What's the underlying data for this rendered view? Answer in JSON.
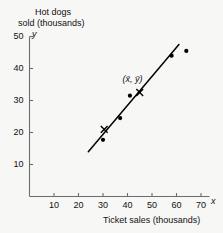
{
  "chart_data": {
    "type": "scatter",
    "title": "",
    "ylabel_lines": [
      "Hot dogs",
      "sold (thousands)"
    ],
    "ylabel": "Hot dogs sold (thousands)",
    "xlabel": "Ticket sales (thousands)",
    "x_axis_letter": "x",
    "y_axis_letter": "y",
    "xlim": [
      0,
      75
    ],
    "ylim": [
      0,
      53
    ],
    "xticks": [
      10,
      20,
      30,
      40,
      50,
      60,
      70
    ],
    "yticks": [
      10,
      20,
      30,
      40,
      50
    ],
    "grid": false,
    "legend": null,
    "points": [
      {
        "x": 30.0,
        "y": 17.7
      },
      {
        "x": 37.0,
        "y": 24.5
      },
      {
        "x": 41.0,
        "y": 31.5
      },
      {
        "x": 58.0,
        "y": 44.0
      },
      {
        "x": 64.0,
        "y": 45.5
      }
    ],
    "cross_markers": [
      {
        "x": 30.5,
        "y": 21.0
      },
      {
        "x": 45.0,
        "y": 32.5
      }
    ],
    "regression_line": {
      "x1": 24.0,
      "y1": 14.0,
      "x2": 61.0,
      "y2": 47.5
    },
    "annotations": [
      {
        "text": "(x̄, ȳ)",
        "x": 42.0,
        "y": 36.5
      }
    ],
    "colors": {
      "background": "#f7f7f5",
      "axis": "#6d6d6d",
      "marker": "#000000",
      "line": "#000000",
      "text": "#111111"
    }
  }
}
